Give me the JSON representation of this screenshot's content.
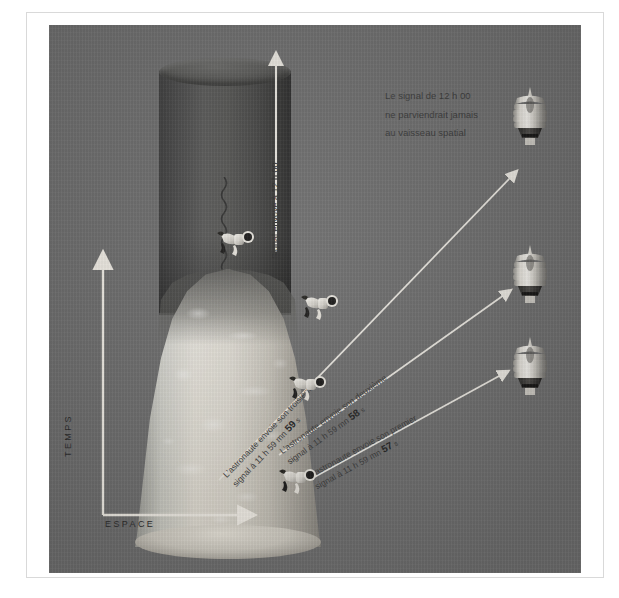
{
  "figure": {
    "axes": {
      "y_label": "TEMPS",
      "x_label": "ESPACE"
    },
    "vertical_signal": {
      "label": "Signal envoyé à 12 h 00"
    },
    "note": {
      "line1": "Le signal de 12 h 00",
      "line2": "ne parviendrait jamais",
      "line3": "au vaisseau spatial"
    },
    "signals": [
      {
        "id": "signal-3",
        "text_lead": "L'astronaute envoie son troisième",
        "text_time_prefix": "signal à 11 h 59 mn",
        "seconds": "59",
        "unit": "s"
      },
      {
        "id": "signal-2",
        "text_lead": "L'astronaute envoie son deuxième",
        "text_time_prefix": "signal à 11 h 59 mn",
        "seconds": "58",
        "unit": "s"
      },
      {
        "id": "signal-1",
        "text_lead": "L'astronaute envoie son premier",
        "text_time_prefix": "signal à 11 h 59 mn",
        "seconds": "57",
        "unit": "s"
      }
    ],
    "colors": {
      "plate": "#6e6e6e",
      "arrow": "#e9e6df",
      "horizon_tube": "#4a4a4a",
      "cone": "#d8d4ca",
      "text": "#3a3a3a",
      "frame": "#d9d9d9"
    },
    "icons": {
      "spacecraft": "spacecraft-icon",
      "astronaut": "astronaut-icon",
      "arrow": "arrow-icon",
      "ripple": "wave-ripple-icon"
    }
  }
}
